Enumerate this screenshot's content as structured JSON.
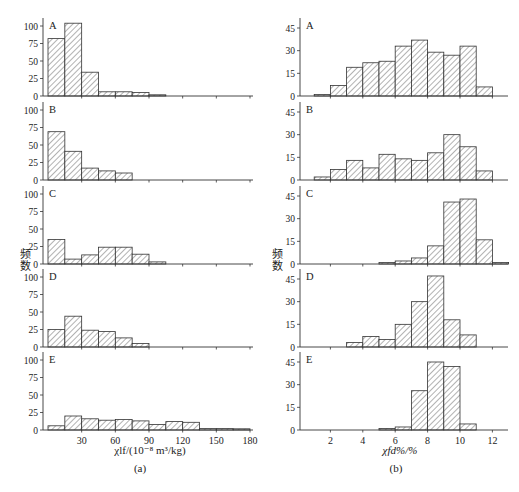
{
  "figure": {
    "subfigure_labels": [
      "(a)",
      "(b)"
    ],
    "ylabel": "频数"
  },
  "chart_data": [
    {
      "type": "bar",
      "id": "a",
      "subfigure": "(a)",
      "xlabel": "χlf/(10⁻⁸ m³/kg)",
      "ylabel": "频数",
      "xlim": [
        0,
        180
      ],
      "ylim": [
        0,
        110
      ],
      "xticks": [
        30,
        60,
        90,
        120,
        150,
        180
      ],
      "yticks": [
        0,
        25,
        50,
        75,
        100
      ],
      "bin_width": 15,
      "bin_edges": [
        0,
        15,
        30,
        45,
        60,
        75,
        90,
        105,
        120,
        135,
        150,
        165,
        180
      ],
      "grid": false,
      "panels": [
        {
          "label": "A",
          "values": [
            82,
            104,
            34,
            6,
            6,
            5,
            1,
            0,
            0,
            0,
            0,
            0
          ]
        },
        {
          "label": "B",
          "values": [
            69,
            41,
            17,
            13,
            10,
            0,
            0,
            0,
            0,
            0,
            0,
            0
          ]
        },
        {
          "label": "C",
          "values": [
            35,
            7,
            13,
            24,
            24,
            14,
            3,
            0,
            0,
            0,
            0,
            0
          ]
        },
        {
          "label": "D",
          "values": [
            25,
            44,
            24,
            22,
            13,
            5,
            0,
            0,
            0,
            0,
            0,
            0
          ]
        },
        {
          "label": "E",
          "values": [
            6,
            20,
            16,
            14,
            15,
            13,
            8,
            12,
            11,
            2,
            2,
            1
          ]
        }
      ]
    },
    {
      "type": "bar",
      "id": "b",
      "subfigure": "(b)",
      "xlabel": "χfd%/%",
      "ylabel": "频数",
      "xlim": [
        0,
        13
      ],
      "ylim": [
        0,
        52
      ],
      "xticks": [
        2,
        4,
        6,
        8,
        10,
        12
      ],
      "yticks": [
        0,
        15,
        30,
        45
      ],
      "bin_width": 1,
      "bin_edges": [
        1,
        2,
        3,
        4,
        5,
        6,
        7,
        8,
        9,
        10,
        11,
        12,
        13
      ],
      "grid": false,
      "panels": [
        {
          "label": "A",
          "values": [
            1,
            7,
            19,
            22,
            23,
            33,
            37,
            29,
            27,
            33,
            6,
            0
          ]
        },
        {
          "label": "B",
          "values": [
            2,
            7,
            13,
            8,
            17,
            14,
            13,
            18,
            30,
            22,
            6,
            0
          ]
        },
        {
          "label": "C",
          "values": [
            0,
            0,
            0,
            0,
            1,
            2,
            4,
            12,
            41,
            43,
            16,
            1
          ]
        },
        {
          "label": "D",
          "values": [
            0,
            0,
            3,
            7,
            5,
            15,
            30,
            47,
            18,
            8,
            0,
            0
          ]
        },
        {
          "label": "E",
          "values": [
            0,
            0,
            0,
            0,
            1,
            2,
            26,
            45,
            42,
            4,
            0,
            0
          ]
        }
      ]
    }
  ]
}
